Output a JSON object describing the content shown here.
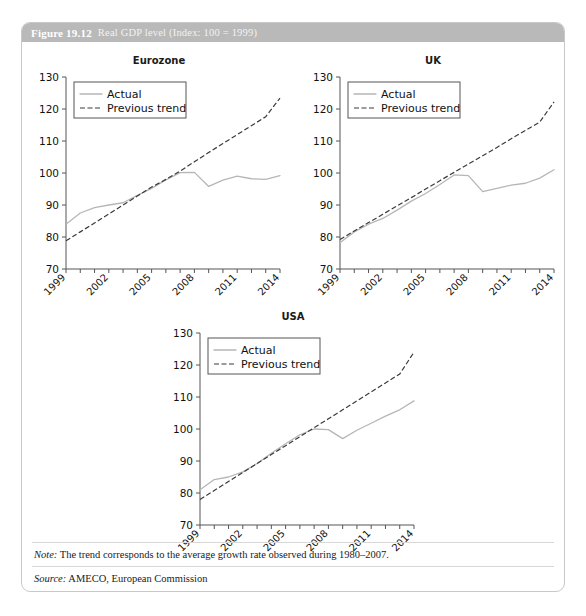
{
  "figure": {
    "number": "Figure 19.12",
    "title": "Real GDP level (Index: 100 = 1999)",
    "note_label": "Note:",
    "note_text": "The trend corresponds to the average growth rate observed during 1980–2007.",
    "source_label": "Source:",
    "source_text": "AMECO, European Commission"
  },
  "legend": {
    "actual": "Actual",
    "trend": "Previous trend"
  },
  "colors": {
    "header_bar": "#b9b9b9",
    "actual_line": "#b6b6b6",
    "trend_line": "#3a3a3a",
    "axis": "#555555",
    "panel_border": "#c9c9c9"
  },
  "chart_data": [
    {
      "type": "line",
      "title": "Eurozone",
      "xlabel": "",
      "ylabel": "",
      "xlim": [
        1999,
        2014
      ],
      "ylim": [
        70,
        130
      ],
      "yticks": [
        70,
        80,
        90,
        100,
        110,
        120,
        130
      ],
      "xticks": [
        1999,
        2000,
        2001,
        2002,
        2003,
        2004,
        2005,
        2006,
        2007,
        2008,
        2009,
        2010,
        2011,
        2012,
        2013,
        2014
      ],
      "xticklabels": [
        "1999",
        "",
        "",
        "2002",
        "",
        "",
        "2005",
        "",
        "",
        "2008",
        "",
        "",
        "2011",
        "",
        "",
        "2014"
      ],
      "grid": false,
      "legend_position": "upper left",
      "x": [
        1999,
        2000,
        2001,
        2002,
        2003,
        2004,
        2005,
        2006,
        2007,
        2008,
        2009,
        2010,
        2011,
        2012,
        2013,
        2014
      ],
      "series": [
        {
          "name": "Actual",
          "values": [
            84.0,
            87.5,
            89.2,
            90.0,
            90.7,
            93.0,
            95.2,
            97.8,
            100.1,
            100.2,
            95.8,
            97.8,
            99.0,
            98.2,
            98.0,
            99.2
          ]
        },
        {
          "name": "Previous trend",
          "values": [
            78.8,
            81.6,
            84.4,
            87.2,
            90.0,
            92.8,
            95.6,
            98.0,
            100.6,
            103.5,
            106.4,
            109.2,
            112.0,
            114.8,
            117.6,
            123.4
          ]
        }
      ]
    },
    {
      "type": "line",
      "title": "UK",
      "xlabel": "",
      "ylabel": "",
      "xlim": [
        1999,
        2014
      ],
      "ylim": [
        70,
        130
      ],
      "yticks": [
        70,
        80,
        90,
        100,
        110,
        120,
        130
      ],
      "xticks": [
        1999,
        2000,
        2001,
        2002,
        2003,
        2004,
        2005,
        2006,
        2007,
        2008,
        2009,
        2010,
        2011,
        2012,
        2013,
        2014
      ],
      "xticklabels": [
        "1999",
        "",
        "",
        "2002",
        "",
        "",
        "2005",
        "",
        "",
        "2008",
        "",
        "",
        "2011",
        "",
        "",
        "2014"
      ],
      "grid": false,
      "legend_position": "upper left",
      "x": [
        1999,
        2000,
        2001,
        2002,
        2003,
        2004,
        2005,
        2006,
        2007,
        2008,
        2009,
        2010,
        2011,
        2012,
        2013,
        2014
      ],
      "series": [
        {
          "name": "Actual",
          "values": [
            78.2,
            81.6,
            84.0,
            85.8,
            88.4,
            91.2,
            93.6,
            96.4,
            99.4,
            99.2,
            94.2,
            95.2,
            96.2,
            96.8,
            98.4,
            101.0
          ]
        },
        {
          "name": "Previous trend",
          "values": [
            79.2,
            81.9,
            84.5,
            87.1,
            89.7,
            92.3,
            95.0,
            97.6,
            100.2,
            102.8,
            105.4,
            108.0,
            110.7,
            113.3,
            115.9,
            122.2
          ]
        }
      ]
    },
    {
      "type": "line",
      "title": "USA",
      "xlabel": "",
      "ylabel": "",
      "xlim": [
        1999,
        2014
      ],
      "ylim": [
        70,
        130
      ],
      "yticks": [
        70,
        80,
        90,
        100,
        110,
        120,
        130
      ],
      "xticks": [
        1999,
        2000,
        2001,
        2002,
        2003,
        2004,
        2005,
        2006,
        2007,
        2008,
        2009,
        2010,
        2011,
        2012,
        2013,
        2014
      ],
      "xticklabels": [
        "1999",
        "",
        "",
        "2002",
        "",
        "",
        "2005",
        "",
        "",
        "2008",
        "",
        "",
        "2011",
        "",
        "",
        "2014"
      ],
      "grid": false,
      "legend_position": "upper left",
      "x": [
        1999,
        2000,
        2001,
        2002,
        2003,
        2004,
        2005,
        2006,
        2007,
        2008,
        2009,
        2010,
        2011,
        2012,
        2013,
        2014
      ],
      "series": [
        {
          "name": "Actual",
          "values": [
            81.0,
            84.2,
            85.0,
            86.6,
            89.2,
            92.4,
            95.4,
            98.2,
            100.0,
            99.8,
            97.0,
            99.6,
            101.8,
            104.0,
            106.0,
            108.8
          ]
        },
        {
          "name": "Previous trend",
          "values": [
            78.0,
            80.8,
            83.6,
            86.4,
            89.2,
            92.0,
            94.8,
            97.6,
            100.4,
            103.2,
            106.0,
            108.8,
            111.6,
            114.4,
            117.2,
            124.0
          ]
        }
      ]
    }
  ]
}
